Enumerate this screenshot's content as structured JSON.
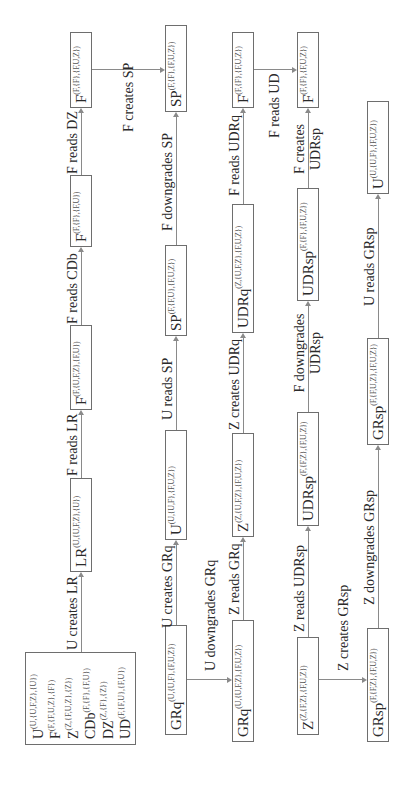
{
  "initial_state": [
    {
      "name": "U",
      "sup": "(U,{U,F,Z},{U})"
    },
    {
      "name": "F",
      "sup": "(F,{F,U,Z},{F})"
    },
    {
      "name": "Z",
      "sup": "(Z,{F,U,Z},{Z})"
    },
    {
      "name": "CDb",
      "sup": "(F,{F},{F,U})"
    },
    {
      "name": "DZ",
      "sup": "(Z,{F},{Z})"
    },
    {
      "name": "UD",
      "sup": "(F,{F,U},{F,U})"
    }
  ],
  "nodes": {
    "lr": {
      "name": "LR",
      "sup": "(U,{U,F,Z},{U})"
    },
    "f1": {
      "name": "F",
      "sup": "(F,{U,F,Z},{F,U})"
    },
    "f2": {
      "name": "F",
      "sup": "(F,{F},{F,U})"
    },
    "f3": {
      "name": "F",
      "sup": "(F,{F},{F,U,Z})"
    },
    "grq1": {
      "name": "GRq",
      "sup": "(U,{U,F},{F,U,Z})"
    },
    "u1": {
      "name": "U",
      "sup": "(U,{U,F},{F,U,Z})"
    },
    "sp2": {
      "name": "SP",
      "sup": "(F,{F,U},{F,U,Z})"
    },
    "sp1": {
      "name": "SP",
      "sup": "(F,{F},{F,U,Z})"
    },
    "grq2": {
      "name": "GRq",
      "sup": "(U,{U,F,Z},{F,U,Z})"
    },
    "z1": {
      "name": "Z",
      "sup": "(Z,{U,F,Z},{F,U,Z})"
    },
    "udrq": {
      "name": "UDRq",
      "sup": "(Z,{U,F,Z},{F,U,Z})"
    },
    "f4": {
      "name": "F",
      "sup": "(F,{F},{F,U,Z})"
    },
    "z2": {
      "name": "Z",
      "sup": "(Z,{F,Z},{F,U,Z})"
    },
    "udrsp2": {
      "name": "UDRsp",
      "sup": "(F,{F,Z},{F,U,Z})"
    },
    "udrsp1": {
      "name": "UDRsp",
      "sup": "(F,{F},{F,U,Z})"
    },
    "f5": {
      "name": "F",
      "sup": "(F,{F},{F,U,Z})"
    },
    "grsp1": {
      "name": "GRsp",
      "sup": "(F,{F,Z},{F,U,Z})"
    },
    "grsp2": {
      "name": "GRsp",
      "sup": "(F,{F,U,Z},{F,U,Z})"
    },
    "u2": {
      "name": "U",
      "sup": "(U,{U,F},{F,U,Z})"
    }
  },
  "edges": {
    "u_creates_lr": "U creates LR",
    "f_reads_lr": "F reads LR",
    "f_reads_cdb": "F reads CDb",
    "f_reads_dz": "F reads DZ",
    "f_creates_sp": "F creates SP",
    "f_downgrades_sp": "F downgrades SP",
    "u_reads_sp": "U reads SP",
    "u_creates_grq": "U creates GRq",
    "u_downgrades_grq": "U downgrades GRq",
    "z_reads_grq": "Z reads GRq",
    "z_creates_udrq": "Z creates UDRq",
    "f_reads_udrq": "F reads UDRq",
    "f_reads_ud": "F reads UD",
    "f_creates_udrsp_1": "F creates",
    "f_creates_udrsp_2": "UDRsp",
    "f_downgrades_udrsp_1": "F downgrades",
    "f_downgrades_udrsp_2": "UDRsp",
    "z_reads_udrsp": "Z reads UDRsp",
    "z_creates_grsp": "Z creates GRsp",
    "z_downgrades_grsp": "Z downgrades GRsp",
    "u_reads_grsp": "U reads GRsp"
  }
}
